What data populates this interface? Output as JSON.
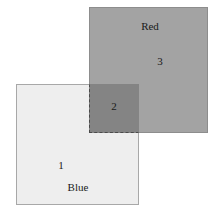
{
  "diagram": {
    "type": "overlapping-squares-venn",
    "background_color": "#ffffff",
    "width": 219,
    "height": 213,
    "regions": [
      {
        "id": "red",
        "name": "Red",
        "number": "3",
        "fill_color": "#a3a3a3",
        "border_color": "#8d8d8d",
        "border_style": "solid"
      },
      {
        "id": "blue",
        "name": "Blue",
        "number": "1",
        "fill_color": "#eeeeee",
        "border_color": "#a8a8a8",
        "border_style": "solid"
      },
      {
        "id": "overlap",
        "name": "",
        "number": "2",
        "fill_color": "#848484",
        "border_color": "#4a4a4a",
        "border_style": "dashed"
      }
    ],
    "labels": {
      "red_name": "Red",
      "red_number": "3",
      "overlap_number": "2",
      "blue_number": "1",
      "blue_name": "Blue"
    }
  }
}
